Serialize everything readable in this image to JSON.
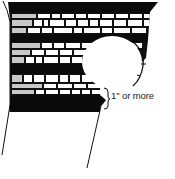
{
  "diagram": {
    "type": "brick-layer-cross-section",
    "annotation": {
      "text": "1\" or more",
      "bracket": "}"
    },
    "colors": {
      "outline": "#111111",
      "band": "#0a0a0a",
      "brick": "#ffffff",
      "brick_shaded": "#c8c8c8",
      "background": "#ffffff"
    }
  }
}
